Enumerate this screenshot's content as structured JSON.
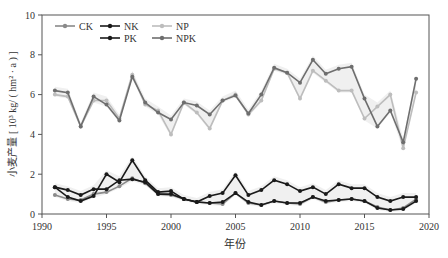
{
  "chart_data": {
    "type": "line",
    "title": "",
    "xlabel": "年份",
    "ylabel": "小麦产量 [ 10³ kg/ ( hm² · a ) ]",
    "xlim": [
      1990,
      2020
    ],
    "ylim": [
      0,
      10
    ],
    "xticks": [
      1990,
      1995,
      2000,
      2005,
      2010,
      2015,
      2020
    ],
    "yticks": [
      0,
      2,
      4,
      6,
      8,
      10
    ],
    "grid": false,
    "legend_position": "top-left",
    "x": [
      1991,
      1992,
      1993,
      1994,
      1995,
      1996,
      1997,
      1998,
      1999,
      2000,
      2001,
      2002,
      2003,
      2004,
      2005,
      2006,
      2007,
      2008,
      2009,
      2010,
      2011,
      2012,
      2013,
      2014,
      2015,
      2016,
      2017,
      2018,
      2019
    ],
    "series": [
      {
        "name": "CK",
        "color": "#8a8a8a",
        "values": [
          0.95,
          0.75,
          0.7,
          1.0,
          1.1,
          1.4,
          1.8,
          1.55,
          1.0,
          0.95,
          0.75,
          0.6,
          0.55,
          0.5,
          1.05,
          0.55,
          0.45,
          0.65,
          0.55,
          0.5,
          0.85,
          0.6,
          0.7,
          0.75,
          0.65,
          0.35,
          0.2,
          0.3,
          0.75
        ]
      },
      {
        "name": "NK",
        "color": "#1a1a1a",
        "values": [
          1.35,
          1.2,
          0.95,
          1.25,
          1.25,
          1.7,
          1.75,
          1.6,
          1.0,
          1.0,
          0.75,
          0.6,
          0.9,
          1.05,
          1.95,
          0.95,
          1.2,
          1.7,
          1.5,
          1.15,
          1.35,
          1.0,
          1.5,
          1.3,
          1.3,
          0.85,
          0.65,
          0.85,
          0.85
        ]
      },
      {
        "name": "NP",
        "color": "#bdbdbd",
        "values": [
          6.0,
          5.9,
          4.4,
          5.7,
          5.7,
          4.8,
          7.0,
          5.5,
          5.2,
          4.0,
          5.6,
          5.1,
          4.3,
          5.7,
          6.0,
          5.0,
          5.7,
          7.3,
          7.1,
          5.8,
          7.2,
          6.7,
          6.2,
          6.2,
          4.8,
          5.4,
          6.0,
          3.3,
          6.1
        ]
      },
      {
        "name": "PK",
        "color": "#1a1a1a",
        "values": [
          1.35,
          0.85,
          0.65,
          0.9,
          2.0,
          1.6,
          2.7,
          1.7,
          1.1,
          1.15,
          0.75,
          0.6,
          0.55,
          0.6,
          1.05,
          0.6,
          0.45,
          0.65,
          0.55,
          0.55,
          0.85,
          0.65,
          0.7,
          0.75,
          0.65,
          0.3,
          0.2,
          0.25,
          0.65
        ]
      },
      {
        "name": "NPK",
        "color": "#6e6e6e",
        "values": [
          6.2,
          6.1,
          4.4,
          5.9,
          5.5,
          4.7,
          6.9,
          5.6,
          5.1,
          4.75,
          5.6,
          5.45,
          5.0,
          5.7,
          5.95,
          5.05,
          6.0,
          7.35,
          7.1,
          6.6,
          7.75,
          7.05,
          7.3,
          7.4,
          5.8,
          4.4,
          5.2,
          3.6,
          6.8
        ]
      }
    ]
  }
}
